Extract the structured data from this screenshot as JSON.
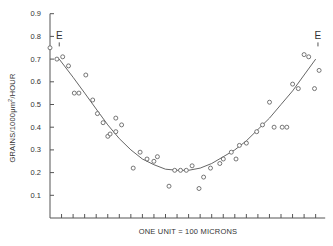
{
  "chart_data": {
    "type": "scatter",
    "title": "",
    "xlabel": "ONE UNIT = 100 MICRONS",
    "ylabel": "GRAINS/1000μm²/HOUR",
    "ylabel_parts": {
      "pre": "GRAINS/1000μm",
      "sup": "2",
      "post": "/HOUR"
    },
    "ylim": [
      0,
      0.9
    ],
    "xlim": [
      0,
      24
    ],
    "yticks": [
      0.1,
      0.2,
      0.3,
      0.4,
      0.5,
      0.6,
      0.7,
      0.8,
      0.9
    ],
    "ytick_labels": [
      "0.1",
      "0.2",
      "0.3",
      "0.4",
      "0.5",
      "0.6",
      "0.7",
      "0.8",
      "0.9"
    ],
    "xticks_count": 23,
    "xtick_labels": [],
    "grid": false,
    "legend": null,
    "annotations": [
      {
        "text": "E",
        "x": 0.8,
        "y": 0.8
      },
      {
        "text": "E",
        "x": 23.2,
        "y": 0.8
      }
    ],
    "series": [
      {
        "name": "observed",
        "marker": "open-circle",
        "points": [
          [
            0.0,
            0.75
          ],
          [
            0.6,
            0.7
          ],
          [
            1.1,
            0.71
          ],
          [
            1.6,
            0.67
          ],
          [
            2.1,
            0.55
          ],
          [
            2.5,
            0.55
          ],
          [
            3.1,
            0.63
          ],
          [
            3.7,
            0.52
          ],
          [
            4.1,
            0.46
          ],
          [
            4.6,
            0.42
          ],
          [
            5.0,
            0.36
          ],
          [
            5.2,
            0.37
          ],
          [
            5.7,
            0.44
          ],
          [
            5.7,
            0.38
          ],
          [
            6.2,
            0.41
          ],
          [
            7.2,
            0.22
          ],
          [
            7.8,
            0.29
          ],
          [
            8.4,
            0.26
          ],
          [
            9.0,
            0.25
          ],
          [
            9.3,
            0.27
          ],
          [
            10.3,
            0.14
          ],
          [
            10.8,
            0.21
          ],
          [
            11.3,
            0.21
          ],
          [
            11.8,
            0.21
          ],
          [
            12.3,
            0.23
          ],
          [
            12.9,
            0.13
          ],
          [
            13.3,
            0.18
          ],
          [
            13.9,
            0.22
          ],
          [
            14.7,
            0.24
          ],
          [
            15.0,
            0.26
          ],
          [
            15.7,
            0.29
          ],
          [
            16.1,
            0.26
          ],
          [
            16.4,
            0.32
          ],
          [
            17.0,
            0.33
          ],
          [
            17.9,
            0.38
          ],
          [
            18.4,
            0.41
          ],
          [
            19.0,
            0.51
          ],
          [
            19.4,
            0.4
          ],
          [
            20.1,
            0.4
          ],
          [
            20.5,
            0.4
          ],
          [
            21.0,
            0.59
          ],
          [
            21.5,
            0.57
          ],
          [
            22.0,
            0.72
          ],
          [
            22.4,
            0.71
          ],
          [
            22.9,
            0.57
          ],
          [
            23.3,
            0.65
          ]
        ]
      },
      {
        "name": "fitted curve",
        "marker": "line",
        "points": [
          [
            0.8,
            0.7
          ],
          [
            2.0,
            0.62
          ],
          [
            3.0,
            0.55
          ],
          [
            4.0,
            0.48
          ],
          [
            5.0,
            0.41
          ],
          [
            6.0,
            0.35
          ],
          [
            7.0,
            0.3
          ],
          [
            8.0,
            0.26
          ],
          [
            9.0,
            0.235
          ],
          [
            10.0,
            0.215
          ],
          [
            11.0,
            0.21
          ],
          [
            12.0,
            0.21
          ],
          [
            13.0,
            0.22
          ],
          [
            14.0,
            0.24
          ],
          [
            15.0,
            0.27
          ],
          [
            16.0,
            0.3
          ],
          [
            17.0,
            0.34
          ],
          [
            18.0,
            0.39
          ],
          [
            19.0,
            0.44
          ],
          [
            20.0,
            0.5
          ],
          [
            21.0,
            0.56
          ],
          [
            22.0,
            0.63
          ],
          [
            23.0,
            0.7
          ]
        ]
      }
    ]
  }
}
